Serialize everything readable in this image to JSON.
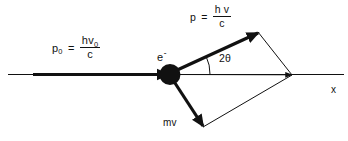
{
  "diagram": {
    "background_color": "#ffffff",
    "stroke_color": "#111111",
    "axis": {
      "name": "x",
      "label": "x",
      "start_x": 8,
      "end_x": 344,
      "y": 74
    },
    "labels": {
      "incident_photon": {
        "symbol": "p",
        "subscript": "0",
        "equals": "=",
        "numerator": "hv",
        "numerator_subscript": "0",
        "denominator": "c",
        "plain": "p0 = hv0 / c"
      },
      "scattered_photon": {
        "symbol": "p",
        "equals": "=",
        "numerator": "h v",
        "denominator": "c",
        "plain": "p = hv / c"
      },
      "electron": {
        "symbol": "e",
        "charge": "-",
        "plain": "e-"
      },
      "angle": {
        "text": "2θ",
        "plain": "2theta",
        "value_degrees": 28
      },
      "recoil_electron": {
        "text": "mv",
        "plain": "mv"
      },
      "axis_label": {
        "text": "x"
      }
    },
    "vectors": [
      {
        "name": "incident-photon-vector",
        "label": "p0 = hv0 / c",
        "from": [
          33,
          74
        ],
        "to": [
          168,
          74
        ],
        "style": "thick-arrow",
        "width": 3.2
      },
      {
        "name": "scattered-photon-vector",
        "label": "p = hv / c",
        "from": [
          170,
          74
        ],
        "to": [
          258,
          32
        ],
        "style": "thick-arrow",
        "width": 3.2
      },
      {
        "name": "recoil-electron-vector",
        "label": "mv",
        "from": [
          170,
          74
        ],
        "to": [
          203,
          127
        ],
        "style": "thick-arrow",
        "width": 3.2
      },
      {
        "name": "resultant-vector",
        "label": "resultant along x",
        "from": [
          170,
          74
        ],
        "to": [
          292,
          75
        ],
        "style": "thin-arrow",
        "width": 1
      }
    ],
    "construction_lines": [
      {
        "name": "parallelogram-upper-edge",
        "from": [
          258,
          32
        ],
        "to": [
          292,
          75
        ]
      },
      {
        "name": "parallelogram-lower-edge",
        "from": [
          203,
          127
        ],
        "to": [
          292,
          75
        ]
      }
    ],
    "particle": {
      "name": "electron-dot",
      "center": [
        170,
        74
      ],
      "radius": 10.5,
      "fill": "#111111"
    },
    "angle_arc": {
      "name": "scattering-angle-arc",
      "center": [
        170,
        74
      ],
      "radius": 40,
      "from_degrees": 0,
      "to_degrees": 25.5
    }
  }
}
